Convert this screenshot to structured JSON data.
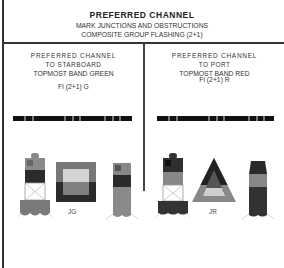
{
  "header": {
    "title": "PREFERRED CHANNEL",
    "subtitle1": "MARK JUNCTIONS AND OBSTRUCTIONS",
    "subtitle2": "COMPOSITE GROUP FLASHING (2+1)"
  },
  "left": {
    "line1": "PREFERRED CHANNEL",
    "line2": "TO STARBOARD",
    "line3": "TOPMOST BAND GREEN",
    "light": "Fl (2+1) G",
    "daymark_label": "JG",
    "color": "#6e6e6e"
  },
  "right": {
    "line1": "PREFERRED CHANNEL",
    "line2": "TO PORT",
    "line3": "TOPMOST BAND RED",
    "light": "Fl (2+1) R",
    "daymark_label": "JR",
    "color": "#3a3a3a"
  }
}
